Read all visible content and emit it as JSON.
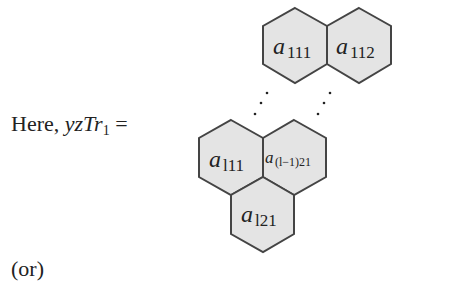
{
  "equation": {
    "prefix_word": "Here,",
    "lhs_var": "yzTr",
    "lhs_sub": "1",
    "equals": "="
  },
  "hexagons": [
    {
      "id": "a111",
      "base": "a",
      "sub": "111"
    },
    {
      "id": "a112",
      "base": "a",
      "sub": "112"
    },
    {
      "id": "al11",
      "base": "a",
      "sub": "l11"
    },
    {
      "id": "a(l-1)21",
      "base": "a",
      "sub": "(l−1)21"
    },
    {
      "id": "al21",
      "base": "a",
      "sub": "l21"
    }
  ],
  "ellipsis": "⋮",
  "trailing_text": "(or)",
  "colors": {
    "hex_fill": "#e4e4e4",
    "hex_stroke": "#444444"
  }
}
